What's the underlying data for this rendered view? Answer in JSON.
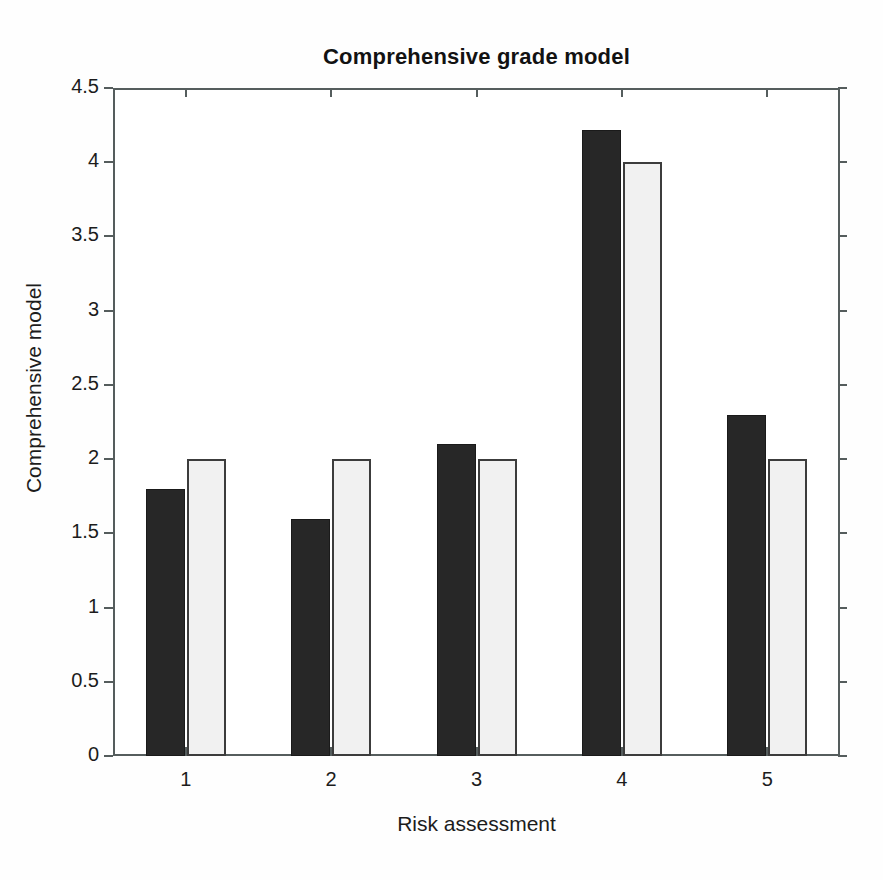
{
  "chart_data": {
    "type": "bar",
    "title": "Comprehensive grade model",
    "xlabel": "Risk assessment",
    "ylabel": "Comprehensive model",
    "categories": [
      "1",
      "2",
      "3",
      "4",
      "5"
    ],
    "series": [
      {
        "name": "dark-series",
        "color": "#272727",
        "values": [
          1.8,
          1.6,
          2.1,
          4.22,
          2.3
        ]
      },
      {
        "name": "light-series",
        "color": "#f1f1f1",
        "values": [
          2.0,
          2.0,
          2.0,
          4.0,
          2.0
        ]
      }
    ],
    "ylim": [
      0,
      4.5
    ],
    "yticks": [
      "0",
      "0.5",
      "1",
      "1.5",
      "2",
      "2.5",
      "3",
      "3.5",
      "4",
      "4.5"
    ],
    "ytick_values": [
      0,
      0.5,
      1,
      1.5,
      2,
      2.5,
      3,
      3.5,
      4,
      4.5
    ],
    "xticks": [
      "1",
      "2",
      "3",
      "4",
      "5"
    ],
    "grid": false,
    "legend": "none",
    "axis_color": "#555d5d",
    "background": "#ffffff"
  }
}
